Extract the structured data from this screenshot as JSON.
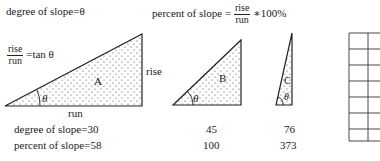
{
  "formulas": {
    "degree_label": "degree of slope=θ",
    "percent_prefix": "percent of slope =",
    "percent_num": "rise",
    "percent_den": "run",
    "percent_suffix": "∗100%",
    "tan_num": "rise",
    "tan_den": "run",
    "tan_suffix": "=tan θ"
  },
  "triangles": [
    {
      "label": "A",
      "angle_label": "θ",
      "side_rise": "rise",
      "side_run": "run"
    },
    {
      "label": "B",
      "angle_label": "θ"
    },
    {
      "label": "C",
      "angle_label": "θ"
    }
  ],
  "values": {
    "degree_prefix": "degree of slope=",
    "percent_prefix": "percent of slope=",
    "degrees": [
      "30",
      "45",
      "76"
    ],
    "percents": [
      "58",
      "100",
      "373"
    ]
  },
  "grid": {
    "rows": 7,
    "visible_columns": 2
  }
}
